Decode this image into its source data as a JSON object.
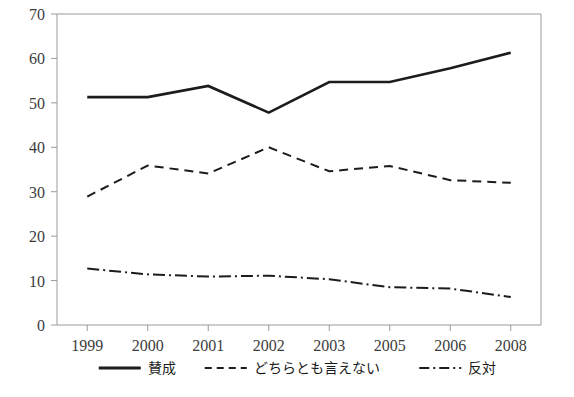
{
  "chart_data": {
    "type": "line",
    "title": "",
    "subtitle": "",
    "xlabel": "",
    "ylabel": "",
    "x": [
      "1999",
      "2000",
      "2001",
      "2002",
      "2003",
      "2005",
      "2006",
      "2008"
    ],
    "categories": [
      "1999",
      "2000",
      "2001",
      "2002",
      "2003",
      "2005",
      "2006",
      "2008"
    ],
    "xtick_labels": [
      "1999",
      "2000",
      "2001",
      "2002",
      "2003",
      "2005",
      "2006",
      "2008"
    ],
    "ylim": [
      0,
      70
    ],
    "ytick_labels": [
      "0",
      "10",
      "20",
      "30",
      "40",
      "50",
      "60",
      "70"
    ],
    "yticks": [
      0,
      10,
      20,
      30,
      40,
      50,
      60,
      70
    ],
    "grid": false,
    "legend_position": "bottom",
    "series": [
      {
        "name": "賛成",
        "style": "solid",
        "color": "#1c1c1c",
        "values": [
          51.3,
          51.3,
          53.8,
          47.8,
          54.7,
          54.7,
          57.8,
          61.3
        ]
      },
      {
        "name": "どちらとも言えない",
        "style": "dashed",
        "color": "#1c1c1c",
        "values": [
          28.9,
          35.9,
          34.1,
          40.0,
          34.6,
          35.8,
          32.6,
          32.0
        ]
      },
      {
        "name": "反対",
        "style": "dash-dot",
        "color": "#1c1c1c",
        "values": [
          12.7,
          11.4,
          10.9,
          11.1,
          10.3,
          8.5,
          8.2,
          6.3
        ]
      }
    ]
  },
  "legend": {
    "items": [
      {
        "label": "賛成",
        "style": "solid"
      },
      {
        "label": "どちらとも言えない",
        "style": "dashed"
      },
      {
        "label": "反対",
        "style": "dash-dot"
      }
    ]
  },
  "axes": {
    "y_axis_name": "value-axis",
    "x_axis_name": "year-axis"
  }
}
